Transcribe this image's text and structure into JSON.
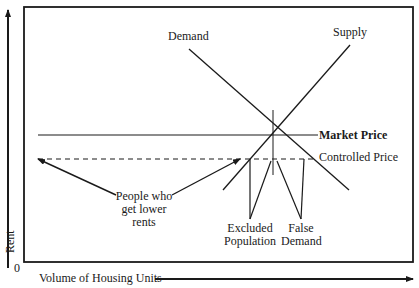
{
  "diagram": {
    "axes": {
      "y_label": "Rent",
      "x_label": "Volume of Housing Units",
      "origin_label": "0"
    },
    "curves": {
      "demand_label": "Demand",
      "supply_label": "Supply"
    },
    "price_lines": {
      "market_price_label": "Market Price",
      "controlled_price_label": "Controlled Price"
    },
    "annotations": {
      "lower_rents": [
        "People who",
        "get lower",
        "rents"
      ],
      "excluded": [
        "Excluded",
        "Population"
      ],
      "false_demand": [
        "False",
        "Demand"
      ]
    },
    "colors": {
      "ink": "#1a1a1a",
      "background": "#ffffff"
    }
  }
}
